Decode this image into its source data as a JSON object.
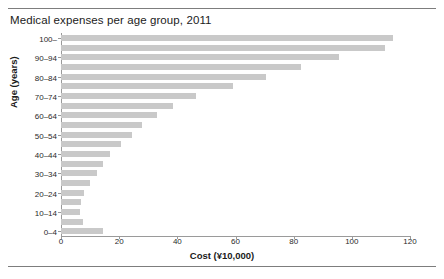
{
  "chart_data": {
    "type": "bar",
    "orientation": "horizontal",
    "title": "Medical expenses per age group, 2011",
    "xlabel": "Cost (¥10,000)",
    "ylabel": "Age (years)",
    "xlim": [
      0,
      120
    ],
    "ylim_categories": 21,
    "grid": false,
    "legend": null,
    "bar_color": "#c9c9c9",
    "axis_color": "#9a9a9a",
    "xticks": [
      0,
      20,
      40,
      60,
      80,
      100,
      120
    ],
    "xtick_labels": [
      "0",
      "20",
      "40",
      "60",
      "80",
      "100",
      "120"
    ],
    "categories": [
      "0–4",
      "5–9",
      "10–14",
      "15–19",
      "20–24",
      "25–29",
      "30–34",
      "35–39",
      "40–44",
      "45–49",
      "50–54",
      "55–59",
      "60–64",
      "65–69",
      "70–74",
      "75–79",
      "80–84",
      "85–89",
      "90–94",
      "95–99",
      "100–"
    ],
    "ytick_labels": [
      "0–4",
      "10–14",
      "20–24",
      "30–34",
      "40–44",
      "50–54",
      "60–64",
      "70–74",
      "80–84",
      "90–94",
      "100–"
    ],
    "values": [
      14.5,
      7.5,
      6.5,
      7.0,
      8.0,
      10.0,
      12.5,
      14.5,
      17.0,
      20.5,
      24.5,
      28.0,
      33.0,
      38.5,
      46.5,
      59.0,
      70.5,
      82.5,
      95.5,
      111.5,
      114.0
    ]
  }
}
